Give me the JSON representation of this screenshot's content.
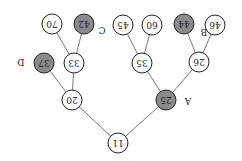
{
  "diagram": {
    "type": "tree",
    "orientation": "rotated-180",
    "colors": {
      "highlight_fill": "#8a8a8a",
      "normal_fill": "#ffffff",
      "stroke": "#222222",
      "edge": "#555555"
    },
    "nodes": [
      {
        "id": "n11",
        "value": "11",
        "x": 118,
        "y": 143,
        "highlight": false
      },
      {
        "id": "n20",
        "value": "20",
        "x": 72,
        "y": 100,
        "highlight": false
      },
      {
        "id": "n25",
        "value": "25",
        "x": 166,
        "y": 100,
        "highlight": true,
        "label": "A"
      },
      {
        "id": "n33",
        "value": "33",
        "x": 74,
        "y": 63,
        "highlight": false
      },
      {
        "id": "n37",
        "value": "37",
        "x": 44,
        "y": 63,
        "highlight": true,
        "label": "D"
      },
      {
        "id": "n35",
        "value": "35",
        "x": 142,
        "y": 63,
        "highlight": false
      },
      {
        "id": "n26",
        "value": "26",
        "x": 199,
        "y": 62,
        "highlight": false
      },
      {
        "id": "n70",
        "value": "70",
        "x": 52,
        "y": 24,
        "highlight": false
      },
      {
        "id": "n42",
        "value": "42",
        "x": 84,
        "y": 24,
        "highlight": true,
        "label": "C"
      },
      {
        "id": "n45",
        "value": "45",
        "x": 123,
        "y": 25,
        "highlight": false
      },
      {
        "id": "n60",
        "value": "60",
        "x": 152,
        "y": 25,
        "highlight": false
      },
      {
        "id": "n44",
        "value": "44",
        "x": 184,
        "y": 24,
        "highlight": true,
        "label": "B"
      },
      {
        "id": "n46",
        "value": "46",
        "x": 215,
        "y": 25,
        "highlight": false
      }
    ],
    "edges": [
      [
        "n11",
        "n20"
      ],
      [
        "n11",
        "n25"
      ],
      [
        "n20",
        "n33"
      ],
      [
        "n20",
        "n37"
      ],
      [
        "n25",
        "n35"
      ],
      [
        "n25",
        "n26"
      ],
      [
        "n33",
        "n70"
      ],
      [
        "n33",
        "n42"
      ],
      [
        "n35",
        "n45"
      ],
      [
        "n35",
        "n60"
      ],
      [
        "n26",
        "n44"
      ],
      [
        "n26",
        "n46"
      ]
    ],
    "labels": [
      {
        "text": "A",
        "x": 188,
        "y": 101
      },
      {
        "text": "B",
        "x": 204,
        "y": 32
      },
      {
        "text": "C",
        "x": 102,
        "y": 30
      },
      {
        "text": "D",
        "x": 21,
        "y": 62
      }
    ]
  }
}
